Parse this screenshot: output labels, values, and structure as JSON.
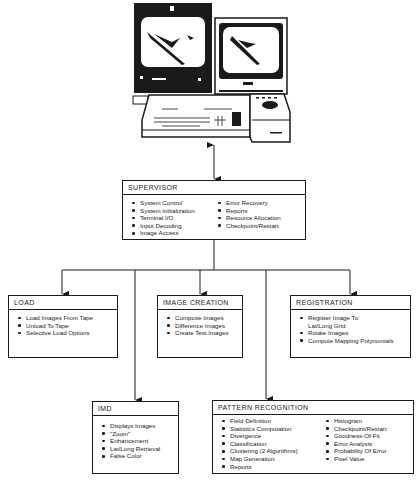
{
  "equipment": {
    "label": "",
    "parts": [
      "monitor-large",
      "monitor-small",
      "keyboard-console",
      "trackball-unit"
    ]
  },
  "supervisor": {
    "title": "SUPERVISOR",
    "col1": [
      "System Control",
      "System Initialization",
      "Terminal I/O",
      "Input Decoding",
      "Image Access"
    ],
    "col2": [
      "Error Recovery",
      "Reports",
      "Resource Allocation",
      "Checkpoint/Restart"
    ]
  },
  "load": {
    "title": "LOAD",
    "items": [
      "Load Images From Tape",
      "Unload To Tape",
      "Selective Load Options"
    ]
  },
  "image_creation": {
    "title": "IMAGE CREATION",
    "items": [
      "Compose Images",
      "Difference Images",
      "Create Test Images"
    ]
  },
  "registration": {
    "title": "REGISTRATION",
    "items": [
      "Register Image To",
      "Lat/Long Grid",
      "Rotate Images",
      "Compute Mapping Polynomials"
    ]
  },
  "imd": {
    "title": "IMD",
    "items": [
      "Displays Images",
      "\"Zoom\"",
      "Enhancement",
      "Lat/Long Retrieval",
      "False Color"
    ]
  },
  "pattern_recognition": {
    "title": "PATTERN RECOGNITION",
    "col1": [
      "Field Definition",
      "Statistics Computation",
      "Divergence",
      "Classification",
      "Clustering (2 Algorithms)",
      "Map Generation",
      "Reports"
    ],
    "col2": [
      "Histogram",
      "Checkpoint/Restart",
      "Goodness-Of-Fit",
      "Error Analysis",
      "Probability Of Error",
      "Pixel Value"
    ]
  },
  "colors": {
    "ink": "#1a1a1a",
    "paper": "#ffffff"
  }
}
